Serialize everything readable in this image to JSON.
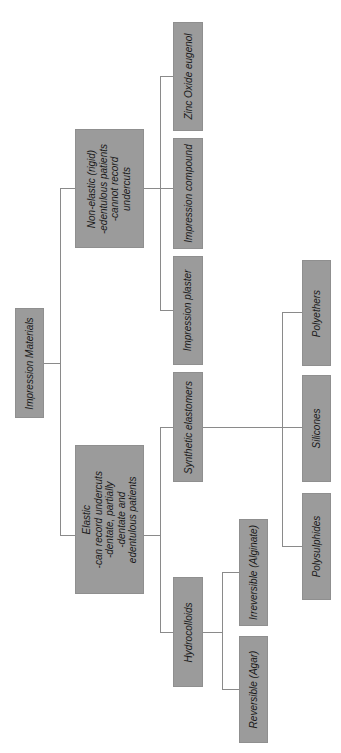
{
  "diagram": {
    "orientation": "rotated 90° counter-clockwise tree",
    "colors": {
      "box_fill": "#9b9b9b",
      "line": "#8a8a8a",
      "text": "#1a1a1a",
      "background": "#ffffff"
    },
    "root": {
      "label": "Impression Materials"
    },
    "nodes": {
      "non_elastic": {
        "label": "Non-elastic (rigid)\n-edentulous patients\n-cannot record\nundercuts"
      },
      "elastic": {
        "label": "Elastic\n-can record undercuts\n-dentate, partially\n-dentate and\nedentulous patients"
      },
      "zinc_oxide": {
        "label": "Zinc Oxide eugenol"
      },
      "impression_compound": {
        "label": "Impression compound"
      },
      "impression_plaster": {
        "label": "Impression plaster"
      },
      "synthetic_elastomers": {
        "label": "Synthetic elastomers"
      },
      "hydrocolloids": {
        "label": "Hydrocolloids"
      },
      "irreversible": {
        "label": "Irreversible (Alginate)"
      },
      "reversible": {
        "label": "Reversible (Agar)"
      },
      "polyethers": {
        "label": "Polyethers"
      },
      "silicones": {
        "label": "Silicones"
      },
      "polysulphides": {
        "label": "Polysulphides"
      }
    },
    "edges": [
      [
        "root",
        "non_elastic"
      ],
      [
        "root",
        "elastic"
      ],
      [
        "non_elastic",
        "zinc_oxide"
      ],
      [
        "non_elastic",
        "impression_compound"
      ],
      [
        "non_elastic",
        "impression_plaster"
      ],
      [
        "elastic",
        "synthetic_elastomers"
      ],
      [
        "elastic",
        "hydrocolloids"
      ],
      [
        "synthetic_elastomers",
        "polyethers"
      ],
      [
        "synthetic_elastomers",
        "silicones"
      ],
      [
        "synthetic_elastomers",
        "polysulphides"
      ],
      [
        "hydrocolloids",
        "irreversible"
      ],
      [
        "hydrocolloids",
        "reversible"
      ]
    ]
  }
}
